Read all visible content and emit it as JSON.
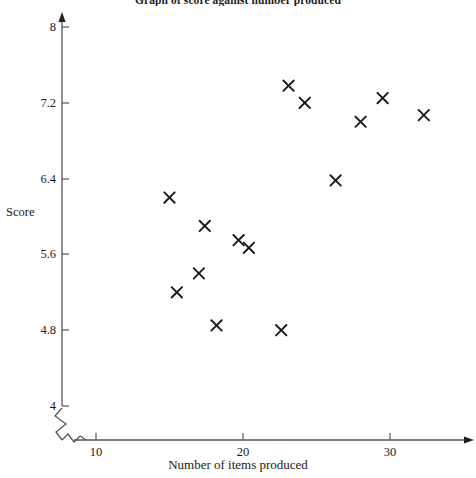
{
  "chart_data": {
    "type": "scatter",
    "title": "Graph of score against number produced",
    "xlabel": "Number of items produced",
    "ylabel": "Score",
    "xlim": [
      8.8,
      33.8
    ],
    "ylim": [
      3.85,
      8.1
    ],
    "grid": false,
    "legend": null,
    "marker": "x",
    "marker_color": "#1a1a1a",
    "axis_break_x": true,
    "axis_break_y": true,
    "xticks": [
      10,
      20,
      30
    ],
    "xtick_labels": [
      "10",
      "20",
      "30"
    ],
    "yticks": [
      4,
      4.8,
      5.6,
      6.4,
      7.2,
      8
    ],
    "ytick_labels": [
      "4",
      "4.8",
      "5.6",
      "6.4",
      "7.2",
      "8"
    ],
    "x": [
      15.0,
      17.4,
      17.0,
      18.2,
      19.7,
      20.4,
      15.5,
      22.6,
      23.1,
      24.2,
      26.3,
      28.0,
      29.5,
      32.3
    ],
    "y": [
      6.2,
      5.9,
      5.4,
      4.85,
      5.75,
      5.67,
      5.2,
      4.8,
      7.38,
      7.2,
      6.38,
      7.0,
      7.25,
      7.07
    ],
    "points": [
      {
        "x": 15.0,
        "y": 6.2
      },
      {
        "x": 15.5,
        "y": 5.2
      },
      {
        "x": 17.0,
        "y": 5.4
      },
      {
        "x": 17.4,
        "y": 5.9
      },
      {
        "x": 18.2,
        "y": 4.85
      },
      {
        "x": 19.7,
        "y": 5.75
      },
      {
        "x": 20.4,
        "y": 5.67
      },
      {
        "x": 22.6,
        "y": 4.8
      },
      {
        "x": 23.1,
        "y": 7.38
      },
      {
        "x": 24.2,
        "y": 7.2
      },
      {
        "x": 26.3,
        "y": 6.38
      },
      {
        "x": 28.0,
        "y": 7.0
      },
      {
        "x": 29.5,
        "y": 7.25
      },
      {
        "x": 32.3,
        "y": 7.07
      }
    ],
    "point_count": 14
  },
  "axes": {
    "y_title": "Score",
    "x_title": "Number of items produced",
    "y_ticks": [
      "8",
      "7.2",
      "6.4",
      "5.6",
      "4.8",
      "4"
    ],
    "x_ticks": [
      "10",
      "20",
      "30"
    ]
  },
  "title": "Graph of score against number produced"
}
